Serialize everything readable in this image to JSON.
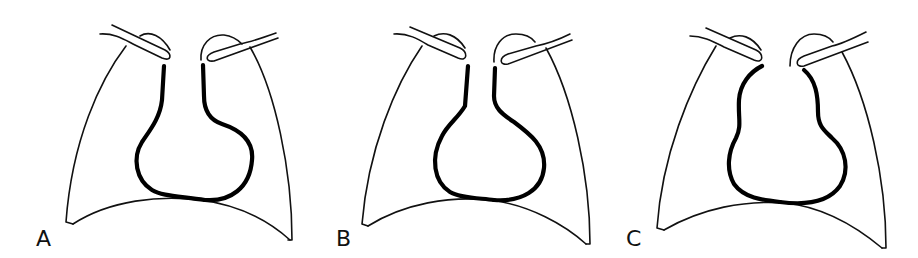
{
  "figure": {
    "type": "chest radiograph outline schematic",
    "colors": {
      "background": "#ffffff",
      "line": "#111111",
      "heart_border": "#000000"
    },
    "panels": [
      {
        "label": "A",
        "heart_shape": "rounded globular cardiac silhouette with left-sided bulge"
      },
      {
        "label": "B",
        "heart_shape": "flask / water-bottle shaped cardiac silhouette with narrow vascular pedicle"
      },
      {
        "label": "C",
        "heart_shape": "pear / gourd shaped cardiac silhouette with widened upper mediastinum"
      }
    ]
  }
}
